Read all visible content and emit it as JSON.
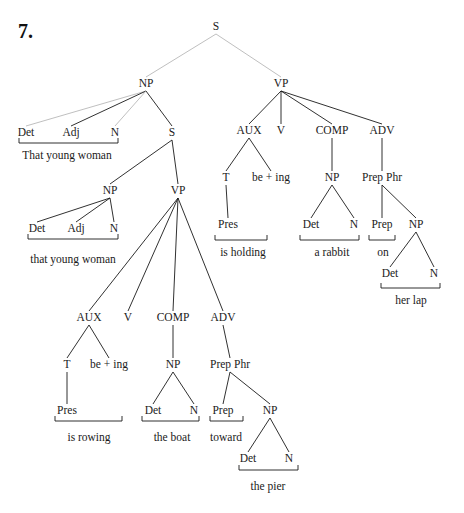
{
  "figure": {
    "number": "7.",
    "type": "syntax-tree",
    "sentence": "That young woman that young woman is rowing the boat toward the pier is holding a rabbit on her lap"
  },
  "nodes": [
    {
      "id": "S0",
      "label": "S",
      "x": 216,
      "y": 30
    },
    {
      "id": "NP1",
      "label": "NP",
      "x": 146,
      "y": 87
    },
    {
      "id": "VP1",
      "label": "VP",
      "x": 281,
      "y": 87
    },
    {
      "id": "Det1",
      "label": "Det",
      "x": 26,
      "y": 136
    },
    {
      "id": "Adj1",
      "label": "Adj",
      "x": 71,
      "y": 136
    },
    {
      "id": "N1",
      "label": "N",
      "x": 115,
      "y": 136
    },
    {
      "id": "S1",
      "label": "S",
      "x": 172,
      "y": 136
    },
    {
      "id": "NP2",
      "label": "NP",
      "x": 110,
      "y": 194
    },
    {
      "id": "VP2",
      "label": "VP",
      "x": 178,
      "y": 194
    },
    {
      "id": "Det2",
      "label": "Det",
      "x": 37,
      "y": 232
    },
    {
      "id": "Adj2",
      "label": "Adj",
      "x": 76,
      "y": 232
    },
    {
      "id": "N2",
      "label": "N",
      "x": 114,
      "y": 232
    },
    {
      "id": "AUX2",
      "label": "AUX",
      "x": 89,
      "y": 321
    },
    {
      "id": "V2",
      "label": "V",
      "x": 128,
      "y": 321
    },
    {
      "id": "COMP2",
      "label": "COMP",
      "x": 173,
      "y": 321
    },
    {
      "id": "ADV2",
      "label": "ADV",
      "x": 223,
      "y": 321
    },
    {
      "id": "T2",
      "label": "T",
      "x": 67,
      "y": 368
    },
    {
      "id": "BE2",
      "label": "be + ing",
      "x": 109,
      "y": 368
    },
    {
      "id": "NP3",
      "label": "NP",
      "x": 173,
      "y": 368
    },
    {
      "id": "PP2",
      "label": "Prep Phr",
      "x": 230,
      "y": 368
    },
    {
      "id": "Pres2",
      "label": "Pres",
      "x": 67,
      "y": 414
    },
    {
      "id": "Det3",
      "label": "Det",
      "x": 153,
      "y": 414
    },
    {
      "id": "N3",
      "label": "N",
      "x": 194,
      "y": 414
    },
    {
      "id": "Prep2",
      "label": "Prep",
      "x": 223,
      "y": 414
    },
    {
      "id": "NP4",
      "label": "NP",
      "x": 270,
      "y": 414
    },
    {
      "id": "Det4",
      "label": "Det",
      "x": 248,
      "y": 462
    },
    {
      "id": "N4",
      "label": "N",
      "x": 289,
      "y": 462
    },
    {
      "id": "AUX1",
      "label": "AUX",
      "x": 249,
      "y": 134
    },
    {
      "id": "V1",
      "label": "V",
      "x": 281,
      "y": 134
    },
    {
      "id": "COMP1",
      "label": "COMP",
      "x": 332,
      "y": 134
    },
    {
      "id": "ADV1",
      "label": "ADV",
      "x": 382,
      "y": 134
    },
    {
      "id": "T1",
      "label": "T",
      "x": 226,
      "y": 181
    },
    {
      "id": "BE1",
      "label": "be + ing",
      "x": 271,
      "y": 181
    },
    {
      "id": "NP5",
      "label": "NP",
      "x": 332,
      "y": 181
    },
    {
      "id": "PP1",
      "label": "Prep Phr",
      "x": 382,
      "y": 181
    },
    {
      "id": "Pres1",
      "label": "Pres",
      "x": 228,
      "y": 228
    },
    {
      "id": "Det5",
      "label": "Det",
      "x": 311,
      "y": 228
    },
    {
      "id": "N5",
      "label": "N",
      "x": 354,
      "y": 228
    },
    {
      "id": "Prep1",
      "label": "Prep",
      "x": 382,
      "y": 228
    },
    {
      "id": "NP6",
      "label": "NP",
      "x": 416,
      "y": 228
    },
    {
      "id": "Det6",
      "label": "Det",
      "x": 390,
      "y": 277
    },
    {
      "id": "N6",
      "label": "N",
      "x": 434,
      "y": 277
    }
  ],
  "edges": [
    {
      "from": "S0",
      "to": "NP1",
      "light": true
    },
    {
      "from": "S0",
      "to": "VP1",
      "light": true
    },
    {
      "from": "NP1",
      "to": "Det1",
      "light": true
    },
    {
      "from": "NP1",
      "to": "Adj1",
      "light": false
    },
    {
      "from": "NP1",
      "to": "N1",
      "light": true
    },
    {
      "from": "NP1",
      "to": "S1",
      "light": false
    },
    {
      "from": "S1",
      "to": "NP2",
      "light": false
    },
    {
      "from": "S1",
      "to": "VP2",
      "light": false
    },
    {
      "from": "NP2",
      "to": "Det2",
      "light": false
    },
    {
      "from": "NP2",
      "to": "Adj2",
      "light": false
    },
    {
      "from": "NP2",
      "to": "N2",
      "light": false
    },
    {
      "from": "VP2",
      "to": "AUX2",
      "light": false
    },
    {
      "from": "VP2",
      "to": "V2",
      "light": false
    },
    {
      "from": "VP2",
      "to": "COMP2",
      "light": false
    },
    {
      "from": "VP2",
      "to": "ADV2",
      "light": false
    },
    {
      "from": "AUX2",
      "to": "T2",
      "light": false
    },
    {
      "from": "AUX2",
      "to": "BE2",
      "light": false
    },
    {
      "from": "T2",
      "to": "Pres2",
      "light": false
    },
    {
      "from": "COMP2",
      "to": "NP3",
      "light": false
    },
    {
      "from": "NP3",
      "to": "Det3",
      "light": false
    },
    {
      "from": "NP3",
      "to": "N3",
      "light": false
    },
    {
      "from": "ADV2",
      "to": "PP2",
      "light": false
    },
    {
      "from": "PP2",
      "to": "Prep2",
      "light": false
    },
    {
      "from": "PP2",
      "to": "NP4",
      "light": false
    },
    {
      "from": "NP4",
      "to": "Det4",
      "light": false
    },
    {
      "from": "NP4",
      "to": "N4",
      "light": false
    },
    {
      "from": "VP1",
      "to": "AUX1",
      "light": false
    },
    {
      "from": "VP1",
      "to": "V1",
      "light": false
    },
    {
      "from": "VP1",
      "to": "COMP1",
      "light": false
    },
    {
      "from": "VP1",
      "to": "ADV1",
      "light": false
    },
    {
      "from": "AUX1",
      "to": "T1",
      "light": false
    },
    {
      "from": "AUX1",
      "to": "BE1",
      "light": false
    },
    {
      "from": "T1",
      "to": "Pres1",
      "light": false
    },
    {
      "from": "COMP1",
      "to": "NP5",
      "light": false
    },
    {
      "from": "NP5",
      "to": "Det5",
      "light": false
    },
    {
      "from": "NP5",
      "to": "N5",
      "light": false
    },
    {
      "from": "ADV1",
      "to": "PP1",
      "light": false
    },
    {
      "from": "PP1",
      "to": "Prep1",
      "light": false
    },
    {
      "from": "PP1",
      "to": "NP6",
      "light": false
    },
    {
      "from": "NP6",
      "to": "Det6",
      "light": false
    },
    {
      "from": "NP6",
      "to": "N6",
      "light": false
    }
  ],
  "brackets": [
    {
      "x1": 19,
      "x2": 118,
      "y": 143,
      "text": "That young woman",
      "tx": 67,
      "ty": 159
    },
    {
      "x1": 28,
      "x2": 118,
      "y": 239,
      "text": "that young woman",
      "tx": 73,
      "ty": 263
    },
    {
      "x1": 55,
      "x2": 122,
      "y": 421,
      "text": "is rowing",
      "tx": 89,
      "ty": 441
    },
    {
      "x1": 142,
      "x2": 199,
      "y": 421,
      "text": "the boat",
      "tx": 172,
      "ty": 441
    },
    {
      "x1": 210,
      "x2": 243,
      "y": 421,
      "text": "toward",
      "tx": 226,
      "ty": 441
    },
    {
      "x1": 239,
      "x2": 298,
      "y": 470,
      "text": "the pier",
      "tx": 268,
      "ty": 490
    },
    {
      "x1": 215,
      "x2": 267,
      "y": 240,
      "text": "is holding",
      "tx": 243,
      "ty": 256
    },
    {
      "x1": 300,
      "x2": 359,
      "y": 240,
      "text": "a rabbit",
      "tx": 332,
      "ty": 256
    },
    {
      "x1": 369,
      "x2": 395,
      "y": 240,
      "text": "on",
      "tx": 383,
      "ty": 256
    },
    {
      "x1": 381,
      "x2": 440,
      "y": 288,
      "text": "her lap",
      "tx": 411,
      "ty": 304
    }
  ]
}
